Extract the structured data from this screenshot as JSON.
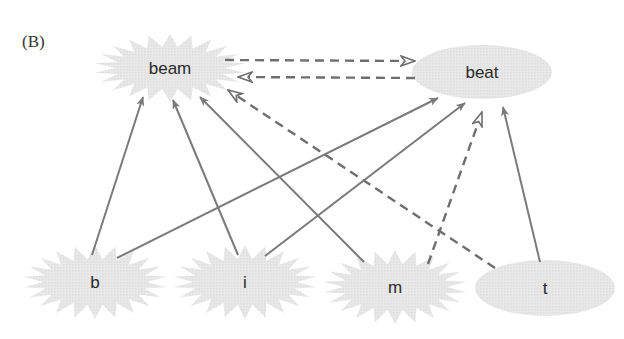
{
  "panel_label": "(B)",
  "colors": {
    "node_fill": "#e6e6e6",
    "edge_solid": "#7a7a7a",
    "edge_dashed": "#6e6e6e",
    "text": "#2a2a2a"
  },
  "nodes": [
    {
      "id": "beam",
      "label": "beam",
      "shape": "starburst",
      "cx": 170,
      "cy": 68,
      "rx": 76,
      "ry": 34
    },
    {
      "id": "beat",
      "label": "beat",
      "shape": "ellipse",
      "cx": 482,
      "cy": 72,
      "rx": 70,
      "ry": 27
    },
    {
      "id": "b",
      "label": "b",
      "shape": "starburst",
      "cx": 95,
      "cy": 282,
      "rx": 72,
      "ry": 37
    },
    {
      "id": "i",
      "label": "i",
      "shape": "starburst",
      "cx": 245,
      "cy": 282,
      "rx": 72,
      "ry": 37
    },
    {
      "id": "m",
      "label": "m",
      "shape": "starburst",
      "cx": 395,
      "cy": 287,
      "rx": 72,
      "ry": 37
    },
    {
      "id": "t",
      "label": "t",
      "shape": "ellipse",
      "cx": 545,
      "cy": 288,
      "rx": 70,
      "ry": 28
    }
  ],
  "edges": [
    {
      "from": "beam",
      "to": "beat",
      "style": "dashed",
      "head": "open",
      "x1": 225,
      "y1": 60,
      "x2": 415,
      "y2": 61
    },
    {
      "from": "beat",
      "to": "beam",
      "style": "dashed",
      "head": "open",
      "x1": 415,
      "y1": 78,
      "x2": 238,
      "y2": 77
    },
    {
      "from": "t",
      "to": "beam",
      "style": "dashed",
      "head": "open",
      "x1": 495,
      "y1": 268,
      "x2": 228,
      "y2": 90
    },
    {
      "from": "m",
      "to": "beat",
      "style": "dashed",
      "head": "open",
      "x1": 428,
      "y1": 264,
      "x2": 482,
      "y2": 112
    },
    {
      "from": "b",
      "to": "beam",
      "style": "solid",
      "head": "filled",
      "x1": 92,
      "y1": 255,
      "x2": 143,
      "y2": 97
    },
    {
      "from": "i",
      "to": "beam",
      "style": "solid",
      "head": "filled",
      "x1": 238,
      "y1": 255,
      "x2": 173,
      "y2": 100
    },
    {
      "from": "m",
      "to": "beam",
      "style": "solid",
      "head": "filled",
      "x1": 364,
      "y1": 262,
      "x2": 200,
      "y2": 97
    },
    {
      "from": "b",
      "to": "beat",
      "style": "solid",
      "head": "filled",
      "x1": 117,
      "y1": 258,
      "x2": 438,
      "y2": 98
    },
    {
      "from": "i",
      "to": "beat",
      "style": "solid",
      "head": "filled",
      "x1": 265,
      "y1": 256,
      "x2": 465,
      "y2": 103
    },
    {
      "from": "t",
      "to": "beat",
      "style": "solid",
      "head": "filled",
      "x1": 540,
      "y1": 262,
      "x2": 503,
      "y2": 107
    }
  ]
}
